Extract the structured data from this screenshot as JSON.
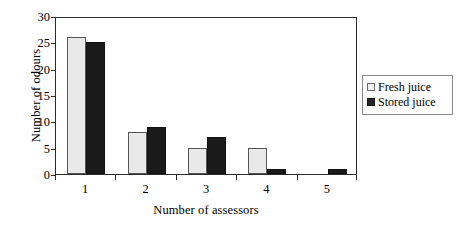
{
  "chart_data": {
    "type": "bar",
    "title": "",
    "xlabel": "Number of assessors",
    "ylabel": "Number of odours",
    "categories": [
      "1",
      "2",
      "3",
      "4",
      "5"
    ],
    "series": [
      {
        "name": "Fresh juice",
        "color": "#e9e9e9",
        "values": [
          26,
          8,
          5,
          5,
          0
        ]
      },
      {
        "name": "Stored juice",
        "color": "#1a1a1a",
        "values": [
          25,
          9,
          7,
          1,
          1
        ]
      }
    ],
    "ylim": [
      0,
      30
    ],
    "ytick_values": [
      0,
      5,
      10,
      15,
      20,
      25,
      30
    ],
    "ytick_labels": [
      "0",
      "5",
      "10",
      "15",
      "20",
      "25",
      "30"
    ],
    "grid": false,
    "legend_position": "right"
  },
  "legend": {
    "items": [
      {
        "label": "Fresh juice",
        "swatch": "fresh-swatch-icon"
      },
      {
        "label": "Stored juice",
        "swatch": "stored-swatch-icon"
      }
    ]
  }
}
